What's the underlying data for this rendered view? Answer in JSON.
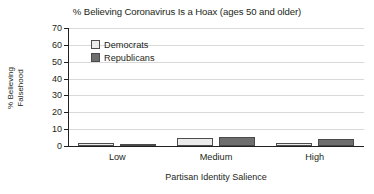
{
  "chart_data": {
    "type": "bar",
    "title": "% Believing Coronavirus Is a Hoax (ages 50 and older)",
    "xlabel": "Partisan Identity Salience",
    "ylabel_line1": "% Believing",
    "ylabel_line2": "Falsehood",
    "categories": [
      "Low",
      "Medium",
      "High"
    ],
    "series": [
      {
        "name": "Democrats",
        "color": "#ebebeb",
        "values": [
          1.5,
          4.5,
          1.8
        ]
      },
      {
        "name": "Republicans",
        "color": "#6e6e6e",
        "values": [
          1.2,
          5.2,
          4.2
        ]
      }
    ],
    "ylim": [
      0,
      70
    ],
    "yticks": [
      "0",
      "10",
      "20",
      "30",
      "40",
      "50",
      "60",
      "70"
    ],
    "ytick_values": [
      0,
      10,
      20,
      30,
      40,
      50,
      60,
      70
    ],
    "grid": true,
    "legend_position": "upper-left-inside"
  }
}
